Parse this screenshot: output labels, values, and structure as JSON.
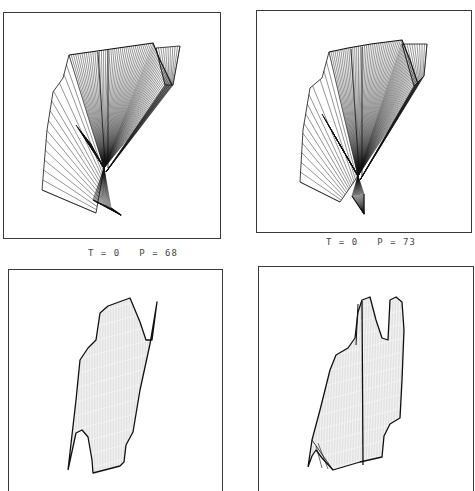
{
  "figure": {
    "panels": [
      {
        "id": "top-left",
        "frame": {
          "x": 3,
          "y": 12,
          "w": 218,
          "h": 227,
          "open_bottom": false
        },
        "caption": "T = 0   P = 68",
        "caption_pos": {
          "x": 88,
          "y": 248
        },
        "style": "fan"
      },
      {
        "id": "top-right",
        "frame": {
          "x": 256,
          "y": 10,
          "w": 216,
          "h": 223,
          "open_bottom": false
        },
        "caption": "T = 0   P = 73",
        "caption_pos": {
          "x": 326,
          "y": 237
        },
        "style": "fan"
      },
      {
        "id": "bottom-left",
        "frame": {
          "x": 8,
          "y": 269,
          "w": 215,
          "h": 222,
          "open_bottom": true
        },
        "caption": "",
        "style": "surface"
      },
      {
        "id": "bottom-right",
        "frame": {
          "x": 258,
          "y": 266,
          "w": 216,
          "h": 225,
          "open_bottom": true
        },
        "caption": "",
        "style": "surface"
      }
    ],
    "ink_color": "#111111"
  }
}
